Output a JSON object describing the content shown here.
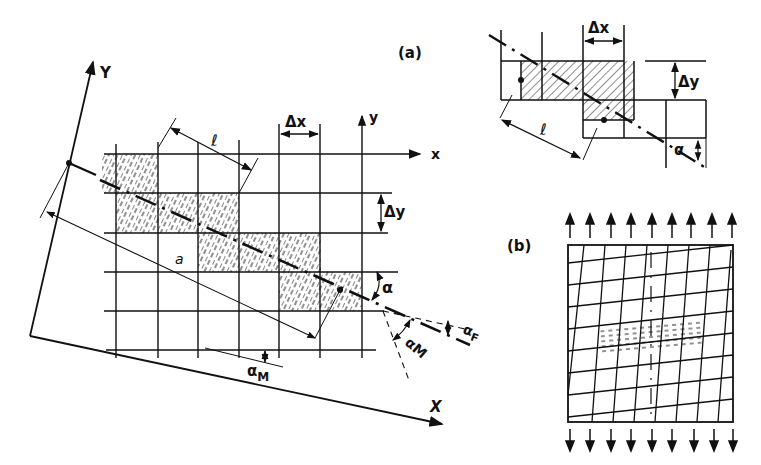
{
  "figure": {
    "panel_a_label": "(a)",
    "panel_b_label": "(b)",
    "ink_color": "#111111",
    "background": "#ffffff"
  },
  "panel_a_main": {
    "global_axes": {
      "X": "X",
      "Y": "Y"
    },
    "local_axes": {
      "x": "x",
      "y": "y"
    },
    "dimensions": {
      "dx": "Δx",
      "dy": "Δy",
      "length": "ℓ",
      "offset": "a"
    },
    "angles": {
      "alpha": "α",
      "alpha_M_bottom": "α",
      "alpha_M_bottom_sub": "M",
      "alpha_M_right": "α",
      "alpha_M_right_sub": "M",
      "alpha_F": "α",
      "alpha_F_sub": "F"
    }
  },
  "panel_a_inset": {
    "dimensions": {
      "dx": "Δx",
      "dy": "Δy",
      "length": "ℓ"
    },
    "angles": {
      "alpha": "α"
    }
  },
  "panel_b": {
    "description": "Deformed grid under tension with crack band",
    "top_arrows": 9,
    "bottom_arrows": 9
  }
}
